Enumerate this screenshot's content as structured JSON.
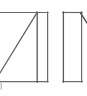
{
  "figure": {
    "title": "",
    "background_color": "#fefefe",
    "stroke_color": "#595959",
    "stroke_color_light": "#8f8f8f",
    "stroke_width": 1.1,
    "width": 87,
    "height": 96
  },
  "shapes": {
    "left_panel": {
      "name": "left-panel-rectangle",
      "description": "rectangular outline cropped at left edge",
      "x": -6,
      "y": 12,
      "width": 54,
      "height": 70,
      "top_edge": "M -6 12 L 48 12",
      "bottom_edge": "M -6 82 L 48 82",
      "right_edge": "M 48 12 L 48 82"
    },
    "left_panel_diagonal": {
      "name": "diagonal-brace-line",
      "description": "diagonal from bottom-left corner to top-right of inner divider",
      "path": "M -5 81 L 37 13"
    },
    "left_panel_divider": {
      "name": "interior-vertical-divider",
      "description": "vertical line inside left panel near right side",
      "path": "M 37 12 L 37 82"
    },
    "right_panel": {
      "name": "right-panel-rectangle",
      "description": "narrow rectangular outline",
      "x": 63,
      "y": 12,
      "width": 19,
      "height": 70,
      "path": "M 63 12 L 82 12 L 82 82 L 63 82 Z"
    },
    "right_panel_stub": {
      "name": "corner-diagonal-stub",
      "description": "short diagonal mark at top-right corner of right panel",
      "path": "M 80 13 L 86 22"
    }
  },
  "annotations": {
    "corner_tick": {
      "name": "bottom-left-corner-tick",
      "label": ""
    }
  }
}
